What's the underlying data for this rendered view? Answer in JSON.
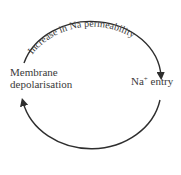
{
  "diagram": {
    "arc_label": "Increase in Na permeability",
    "nodes": [
      {
        "id": "membrane",
        "line1": "Membrane",
        "line2": "depolarisation"
      },
      {
        "id": "na_entry",
        "prefix": "Na",
        "superscript": "+",
        "suffix": " entry"
      }
    ],
    "edges": [
      {
        "from": "membrane",
        "to": "na_entry",
        "label": "Increase in Na permeability",
        "path": "top-arc"
      },
      {
        "from": "na_entry",
        "to": "membrane",
        "label": "",
        "path": "bottom-arc"
      }
    ],
    "colors": {
      "stroke": "#2e2e2e",
      "text": "#3a3a3a",
      "background": "#ffffff"
    }
  }
}
